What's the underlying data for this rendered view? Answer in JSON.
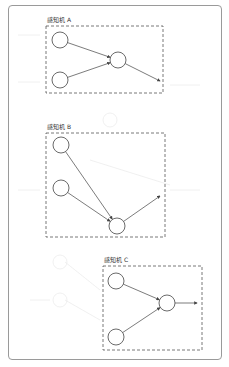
{
  "diagram": {
    "type": "perceptron-grouping",
    "colors": {
      "frame": "#9a9a9a",
      "stroke": "#444444",
      "dashed": "#555555",
      "ghost": "#ebebeb"
    },
    "perceptrons": [
      {
        "label": "感知机 A",
        "box": {
          "x": 46,
          "y": 26,
          "w": 117,
          "h": 67
        },
        "inputs": [
          {
            "cx": 60,
            "cy": 40
          },
          {
            "cx": 60,
            "cy": 80
          }
        ],
        "output": {
          "cx": 118,
          "cy": 60
        },
        "arrow_end": {
          "x": 160,
          "y": 81
        }
      },
      {
        "label": "感知机 B",
        "box": {
          "x": 46,
          "y": 133,
          "w": 119,
          "h": 104
        },
        "inputs": [
          {
            "cx": 61,
            "cy": 145
          },
          {
            "cx": 61,
            "cy": 188
          }
        ],
        "output": {
          "cx": 117,
          "cy": 226
        },
        "arrow_end": {
          "x": 160,
          "y": 196
        }
      },
      {
        "label": "感知机 C",
        "box": {
          "x": 103,
          "y": 266,
          "w": 99,
          "h": 84
        },
        "inputs": [
          {
            "cx": 116,
            "cy": 281
          },
          {
            "cx": 116,
            "cy": 337
          }
        ],
        "output": {
          "cx": 167,
          "cy": 303
        },
        "arrow_end": {
          "x": 197,
          "y": 303
        }
      }
    ],
    "node_radius": 8
  }
}
